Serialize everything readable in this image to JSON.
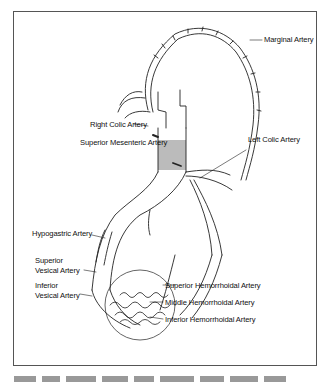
{
  "figure": {
    "labels": {
      "marginal": "Marginal Artery",
      "right_colic": "Right Colic Artery",
      "superior_mesenteric": "Superior Mesenteric Artery",
      "left_colic": "Left Colic Artery",
      "hypogastric": "Hypogastric Artery",
      "superior_vesical_1": "Superior",
      "superior_vesical_2": "Vesical Artery",
      "inferior_vesical_1": "Inferior",
      "inferior_vesical_2": "Vesical Artery",
      "superior_hemorrhoidal": "Superior Hemorrhoidal Artery",
      "middle_hemorrhoidal": "Middle Hemorrhoidal Artery",
      "inferior_hemorrhoidal": "Inferior Hemorrhoidal Artery"
    },
    "colors": {
      "line": "#222222",
      "shade": "#b8b8b8",
      "frame": "#555555"
    }
  }
}
